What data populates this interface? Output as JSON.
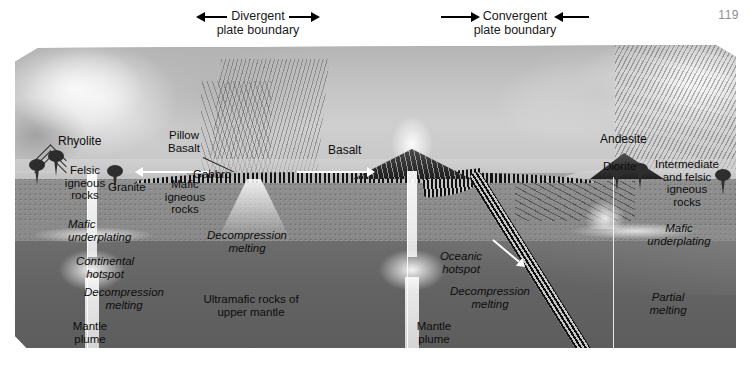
{
  "page": {
    "number": "119"
  },
  "figure": {
    "type": "geologic-block-diagram"
  },
  "boundaries": [
    {
      "id": "divergent",
      "line1": "Divergent",
      "line2": "plate boundary",
      "arrow_left": "◀",
      "arrow_right": "▶",
      "direction": "outward"
    },
    {
      "id": "convergent",
      "line1": "Convergent",
      "line2": "plate boundary",
      "arrow_left": "▶",
      "arrow_right": "◀",
      "direction": "inward"
    }
  ],
  "labels": {
    "rhyolite": "Rhyolite",
    "felsic_igneous_rocks": "Felsic\nigneous\nrocks",
    "granite": "Granite",
    "pillow_basalt": "Pillow\nBasalt",
    "gabbro": "Gabbro",
    "mafic_igneous_rocks": "Mafic\nigneous\nrocks",
    "basalt": "Basalt",
    "andesite": "Andesite",
    "diorite": "Diorite",
    "intermediate_felsic": "Intermediate\nand felsic\nigneous\nrocks",
    "mafic_underplating_left": "Mafic\nunderplating",
    "mafic_underplating_right": "Mafic\nunderplating",
    "continental_hotspot": "Continental\nhotspot",
    "oceanic_hotspot": "Oceanic\nhotspot",
    "decompression_melting_left": "Decompression\nmelting",
    "decompression_melting_ridge": "Decompression\nmelting",
    "decompression_melting_oceanic": "Decompression\nmelting",
    "mantle_plume_left": "Mantle\nplume",
    "mantle_plume_right": "Mantle\nplume",
    "ultramafic_rocks": "Ultramafic rocks of\nupper mantle",
    "partial_melting": "Partial\nmelting"
  },
  "colors": {
    "page_background": "#ffffff",
    "upper_mantle": "#8f8f8f",
    "deep_mantle": "#646464",
    "oceanic_crust": "#1a1a1a",
    "landscape": "#c6c6c6",
    "plume": "#fafafa",
    "text": "#0d0d0d",
    "page_number": "#8d8d8d"
  }
}
